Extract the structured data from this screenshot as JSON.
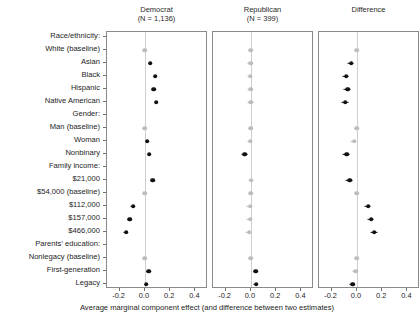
{
  "figure": {
    "x_axis_title": "Average marginal component effect (and difference between two estimates)",
    "x_ticks": [
      "-0.2",
      "0.0",
      "0.2",
      "0.4"
    ],
    "x_tick_values": [
      -0.2,
      0.0,
      0.2,
      0.4
    ],
    "xlim": [
      -0.3,
      0.5
    ],
    "colors": {
      "significant": "#111111",
      "nonsignificant": "#bdbdbd",
      "zero_line": "#cfcfcf",
      "panel_border": "#8a8a8a",
      "background": "#ffffff"
    }
  },
  "panels": [
    {
      "title": "Democrat",
      "subtitle": "(N = 1,136)"
    },
    {
      "title": "Republican",
      "subtitle": "(N = 399)"
    },
    {
      "title": "Difference",
      "subtitle": ""
    }
  ],
  "rows": [
    {
      "label": "Race/ethnicity:",
      "type": "group"
    },
    {
      "label": "White (baseline)",
      "type": "item"
    },
    {
      "label": "Asian",
      "type": "item"
    },
    {
      "label": "Black",
      "type": "item"
    },
    {
      "label": "Hispanic",
      "type": "item"
    },
    {
      "label": "Native American",
      "type": "item"
    },
    {
      "label": "Gender:",
      "type": "group"
    },
    {
      "label": "Man (baseline)",
      "type": "item"
    },
    {
      "label": "Woman",
      "type": "item"
    },
    {
      "label": "Nonbinary",
      "type": "item"
    },
    {
      "label": "Family income:",
      "type": "group"
    },
    {
      "label": "$21,000",
      "type": "item"
    },
    {
      "label": "$54,000 (baseline)",
      "type": "item"
    },
    {
      "label": "$112,000",
      "type": "item"
    },
    {
      "label": "$157,000",
      "type": "item"
    },
    {
      "label": "$466,000",
      "type": "item"
    },
    {
      "label": "Parents' education:",
      "type": "group"
    },
    {
      "label": "Nonlegacy (baseline)",
      "type": "item"
    },
    {
      "label": "First-generation",
      "type": "item"
    },
    {
      "label": "Legacy",
      "type": "item"
    }
  ],
  "chart_data": {
    "type": "scatter",
    "title": "",
    "xlabel": "Average marginal component effect (and difference between two estimates)",
    "ylabel": "",
    "xlim": [
      -0.3,
      0.5
    ],
    "xticks": [
      -0.2,
      0.0,
      0.2,
      0.4
    ],
    "grid": false,
    "legend": "none",
    "reference_line_x": 0.0,
    "categories": [
      "Race/ethnicity:",
      "White (baseline)",
      "Asian",
      "Black",
      "Hispanic",
      "Native American",
      "Gender:",
      "Man (baseline)",
      "Woman",
      "Nonbinary",
      "Family income:",
      "$21,000",
      "$54,000 (baseline)",
      "$112,000",
      "$157,000",
      "$466,000",
      "Parents' education:",
      "Nonlegacy (baseline)",
      "First-generation",
      "Legacy"
    ],
    "series": [
      {
        "name": "Democrat",
        "n": 1136,
        "points": [
          {
            "category": "Race/ethnicity:",
            "estimate": null,
            "ci_low": null,
            "ci_high": null,
            "significant": false
          },
          {
            "category": "White (baseline)",
            "estimate": 0.0,
            "ci_low": 0.0,
            "ci_high": 0.0,
            "significant": false
          },
          {
            "category": "Asian",
            "estimate": 0.042,
            "ci_low": 0.03,
            "ci_high": 0.054,
            "significant": true
          },
          {
            "category": "Black",
            "estimate": 0.082,
            "ci_low": 0.069,
            "ci_high": 0.095,
            "significant": true
          },
          {
            "category": "Hispanic",
            "estimate": 0.07,
            "ci_low": 0.058,
            "ci_high": 0.083,
            "significant": true
          },
          {
            "category": "Native American",
            "estimate": 0.091,
            "ci_low": 0.078,
            "ci_high": 0.104,
            "significant": true
          },
          {
            "category": "Gender:",
            "estimate": null,
            "ci_low": null,
            "ci_high": null,
            "significant": false
          },
          {
            "category": "Man (baseline)",
            "estimate": 0.0,
            "ci_low": 0.0,
            "ci_high": 0.0,
            "significant": false
          },
          {
            "category": "Woman",
            "estimate": 0.018,
            "ci_low": 0.008,
            "ci_high": 0.028,
            "significant": true
          },
          {
            "category": "Nonbinary",
            "estimate": 0.034,
            "ci_low": 0.022,
            "ci_high": 0.046,
            "significant": true
          },
          {
            "category": "Family income:",
            "estimate": null,
            "ci_low": null,
            "ci_high": null,
            "significant": false
          },
          {
            "category": "$21,000",
            "estimate": 0.061,
            "ci_low": 0.048,
            "ci_high": 0.074,
            "significant": true
          },
          {
            "category": "$54,000 (baseline)",
            "estimate": 0.0,
            "ci_low": 0.0,
            "ci_high": 0.0,
            "significant": false
          },
          {
            "category": "$112,000",
            "estimate": -0.094,
            "ci_low": -0.107,
            "ci_high": -0.081,
            "significant": true
          },
          {
            "category": "$157,000",
            "estimate": -0.118,
            "ci_low": -0.131,
            "ci_high": -0.105,
            "significant": true
          },
          {
            "category": "$466,000",
            "estimate": -0.148,
            "ci_low": -0.162,
            "ci_high": -0.134,
            "significant": true
          },
          {
            "category": "Parents' education:",
            "estimate": null,
            "ci_low": null,
            "ci_high": null,
            "significant": false
          },
          {
            "category": "Nonlegacy (baseline)",
            "estimate": 0.0,
            "ci_low": 0.0,
            "ci_high": 0.0,
            "significant": false
          },
          {
            "category": "First-generation",
            "estimate": 0.03,
            "ci_low": 0.019,
            "ci_high": 0.041,
            "significant": true
          },
          {
            "category": "Legacy",
            "estimate": 0.01,
            "ci_low": -0.001,
            "ci_high": 0.021,
            "significant": true
          }
        ]
      },
      {
        "name": "Republican",
        "n": 399,
        "points": [
          {
            "category": "Race/ethnicity:",
            "estimate": null,
            "ci_low": null,
            "ci_high": null,
            "significant": false
          },
          {
            "category": "White (baseline)",
            "estimate": 0.0,
            "ci_low": 0.0,
            "ci_high": 0.0,
            "significant": false
          },
          {
            "category": "Asian",
            "estimate": -0.002,
            "ci_low": -0.024,
            "ci_high": 0.02,
            "significant": false
          },
          {
            "category": "Black",
            "estimate": -0.004,
            "ci_low": -0.026,
            "ci_high": 0.018,
            "significant": false
          },
          {
            "category": "Hispanic",
            "estimate": -0.003,
            "ci_low": -0.025,
            "ci_high": 0.019,
            "significant": false
          },
          {
            "category": "Native American",
            "estimate": -0.001,
            "ci_low": -0.024,
            "ci_high": 0.022,
            "significant": false
          },
          {
            "category": "Gender:",
            "estimate": null,
            "ci_low": null,
            "ci_high": null,
            "significant": false
          },
          {
            "category": "Man (baseline)",
            "estimate": 0.0,
            "ci_low": 0.0,
            "ci_high": 0.0,
            "significant": false
          },
          {
            "category": "Woman",
            "estimate": -0.004,
            "ci_low": -0.022,
            "ci_high": 0.014,
            "significant": false
          },
          {
            "category": "Nonbinary",
            "estimate": -0.048,
            "ci_low": -0.07,
            "ci_high": -0.026,
            "significant": true
          },
          {
            "category": "Family income:",
            "estimate": null,
            "ci_low": null,
            "ci_high": null,
            "significant": false
          },
          {
            "category": "$21,000",
            "estimate": 0.004,
            "ci_low": -0.018,
            "ci_high": 0.026,
            "significant": false
          },
          {
            "category": "$54,000 (baseline)",
            "estimate": 0.0,
            "ci_low": 0.0,
            "ci_high": 0.0,
            "significant": false
          },
          {
            "category": "$112,000",
            "estimate": -0.005,
            "ci_low": -0.027,
            "ci_high": 0.017,
            "significant": false
          },
          {
            "category": "$157,000",
            "estimate": -0.006,
            "ci_low": -0.029,
            "ci_high": 0.017,
            "significant": false
          },
          {
            "category": "$466,000",
            "estimate": -0.012,
            "ci_low": -0.036,
            "ci_high": 0.012,
            "significant": false
          },
          {
            "category": "Parents' education:",
            "estimate": null,
            "ci_low": null,
            "ci_high": null,
            "significant": false
          },
          {
            "category": "Nonlegacy (baseline)",
            "estimate": 0.0,
            "ci_low": 0.0,
            "ci_high": 0.0,
            "significant": false
          },
          {
            "category": "First-generation",
            "estimate": 0.04,
            "ci_low": 0.022,
            "ci_high": 0.058,
            "significant": true
          },
          {
            "category": "Legacy",
            "estimate": 0.042,
            "ci_low": 0.024,
            "ci_high": 0.06,
            "significant": true
          }
        ]
      },
      {
        "name": "Difference",
        "n": null,
        "points": [
          {
            "category": "Race/ethnicity:",
            "estimate": null,
            "ci_low": null,
            "ci_high": null,
            "significant": false
          },
          {
            "category": "White (baseline)",
            "estimate": 0.0,
            "ci_low": 0.0,
            "ci_high": 0.0,
            "significant": false
          },
          {
            "category": "Asian",
            "estimate": -0.044,
            "ci_low": -0.069,
            "ci_high": -0.019,
            "significant": true
          },
          {
            "category": "Black",
            "estimate": -0.086,
            "ci_low": -0.112,
            "ci_high": -0.06,
            "significant": true
          },
          {
            "category": "Hispanic",
            "estimate": -0.073,
            "ci_low": -0.099,
            "ci_high": -0.047,
            "significant": true
          },
          {
            "category": "Native American",
            "estimate": -0.092,
            "ci_low": -0.118,
            "ci_high": -0.066,
            "significant": true
          },
          {
            "category": "Gender:",
            "estimate": null,
            "ci_low": null,
            "ci_high": null,
            "significant": false
          },
          {
            "category": "Man (baseline)",
            "estimate": 0.0,
            "ci_low": 0.0,
            "ci_high": 0.0,
            "significant": false
          },
          {
            "category": "Woman",
            "estimate": -0.022,
            "ci_low": -0.043,
            "ci_high": -0.001,
            "significant": false
          },
          {
            "category": "Nonbinary",
            "estimate": -0.082,
            "ci_low": -0.107,
            "ci_high": -0.057,
            "significant": true
          },
          {
            "category": "Family income:",
            "estimate": null,
            "ci_low": null,
            "ci_high": null,
            "significant": false
          },
          {
            "category": "$21,000",
            "estimate": -0.057,
            "ci_low": -0.083,
            "ci_high": -0.031,
            "significant": true
          },
          {
            "category": "$54,000 (baseline)",
            "estimate": 0.0,
            "ci_low": 0.0,
            "ci_high": 0.0,
            "significant": false
          },
          {
            "category": "$112,000",
            "estimate": 0.089,
            "ci_low": 0.063,
            "ci_high": 0.115,
            "significant": true
          },
          {
            "category": "$157,000",
            "estimate": 0.112,
            "ci_low": 0.086,
            "ci_high": 0.138,
            "significant": true
          },
          {
            "category": "$466,000",
            "estimate": 0.136,
            "ci_low": 0.108,
            "ci_high": 0.164,
            "significant": true
          },
          {
            "category": "Parents' education:",
            "estimate": null,
            "ci_low": null,
            "ci_high": null,
            "significant": false
          },
          {
            "category": "Nonlegacy (baseline)",
            "estimate": 0.0,
            "ci_low": 0.0,
            "ci_high": 0.0,
            "significant": false
          },
          {
            "category": "First-generation",
            "estimate": -0.01,
            "ci_low": -0.031,
            "ci_high": 0.011,
            "significant": false
          },
          {
            "category": "Legacy",
            "estimate": -0.032,
            "ci_low": -0.053,
            "ci_high": -0.011,
            "significant": true
          }
        ]
      }
    ]
  }
}
